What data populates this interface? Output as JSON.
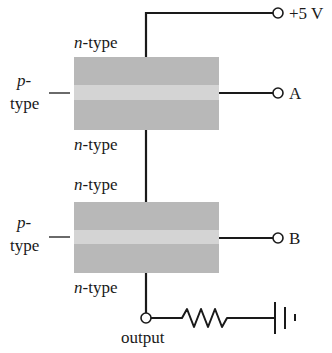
{
  "diagram": {
    "terminals": {
      "supply": "+5 V",
      "input_a": "A",
      "input_b": "B",
      "output": "output"
    },
    "transistor_top": {
      "top_label_italic": "n",
      "top_label_rest": "-type",
      "bottom_label_italic": "n",
      "bottom_label_rest": "-type",
      "side_label_line1": "p-",
      "side_label_line2": "type"
    },
    "transistor_bottom": {
      "top_label_italic": "n",
      "top_label_rest": "-type",
      "bottom_label_italic": "n",
      "bottom_label_rest": "-type",
      "side_label_line1": "p-",
      "side_label_line2": "type"
    },
    "colors": {
      "block_dark": "#b8b8b8",
      "block_band": "#d4d4d4",
      "wire": "#1a1a1a"
    }
  }
}
